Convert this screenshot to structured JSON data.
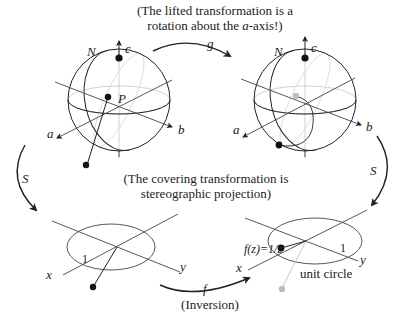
{
  "captions": {
    "top_line1": "(The lifted transformation is a",
    "top_line2_pre": "rotation about the ",
    "top_line2_axis": "a",
    "top_line2_post": "-axis!)",
    "middle_line1": "(The covering transformation is",
    "middle_line2": "stereographic projection)",
    "bottom": "(Inversion)"
  },
  "arrows": {
    "top": "g",
    "left": "S",
    "right": "S",
    "bottom": "f"
  },
  "left_sphere": {
    "north_label": "N",
    "axis_c": "c",
    "axis_a": "a",
    "axis_b": "b",
    "point_label": "P"
  },
  "right_sphere": {
    "north_label": "N",
    "axis_c": "c",
    "axis_a": "a",
    "axis_b": "b"
  },
  "left_plane": {
    "axis_x": "x",
    "axis_y": "y",
    "unit_label": "1"
  },
  "right_plane": {
    "axis_x": "x",
    "axis_y": "y",
    "unit_label": "1",
    "point_label": "f(z)=1/z",
    "circle_label": "unit circle"
  },
  "colors": {
    "ink": "#222222",
    "faint": "#bbbbbb",
    "ghost_point": "#bdbdbd"
  }
}
